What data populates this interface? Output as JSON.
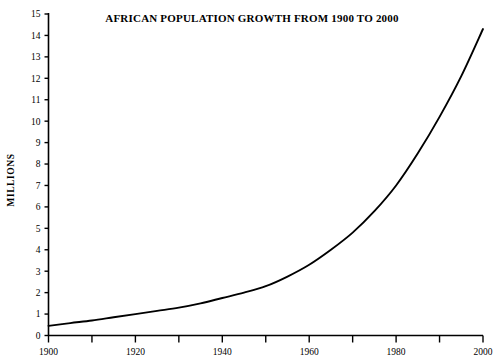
{
  "chart_data": {
    "type": "line",
    "title": "AFRICAN POPULATION GROWTH FROM 1900 TO 2000",
    "xlabel": "",
    "ylabel": "MILLIONS",
    "xlim": [
      1900,
      2000
    ],
    "ylim": [
      0,
      15
    ],
    "grid": false,
    "legend": null,
    "x_tick_interval": 10,
    "x_label_interval": 20,
    "y_tick_interval": 1,
    "x_tick_values": [
      1900,
      1910,
      1920,
      1930,
      1940,
      1950,
      1960,
      1970,
      1980,
      1990,
      2000
    ],
    "x_tick_labels": [
      "1900",
      "",
      "1920",
      "",
      "1940",
      "",
      "1960",
      "",
      "1980",
      "",
      "2000"
    ],
    "y_tick_values": [
      0,
      1,
      2,
      3,
      4,
      5,
      6,
      7,
      8,
      9,
      10,
      11,
      12,
      13,
      14,
      15
    ],
    "y_tick_labels": [
      "0",
      "1",
      "2",
      "3",
      "4",
      "5",
      "6",
      "7",
      "8",
      "9",
      "10",
      "11",
      "12",
      "13",
      "14",
      "15"
    ],
    "series": [
      {
        "name": "African population",
        "color": "#000000",
        "x": [
          1900,
          1905,
          1910,
          1915,
          1920,
          1925,
          1930,
          1935,
          1940,
          1945,
          1950,
          1955,
          1960,
          1965,
          1970,
          1975,
          1980,
          1985,
          1990,
          1995,
          2000
        ],
        "values": [
          0.45,
          0.58,
          0.7,
          0.85,
          1.0,
          1.15,
          1.3,
          1.5,
          1.75,
          2.0,
          2.3,
          2.75,
          3.3,
          4.0,
          4.8,
          5.8,
          7.0,
          8.5,
          10.2,
          12.1,
          14.3
        ]
      }
    ]
  },
  "axes": {
    "line_color": "#000000",
    "curve_color": "#000000"
  }
}
